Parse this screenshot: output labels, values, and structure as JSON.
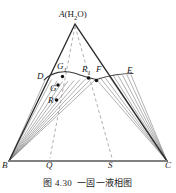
{
  "figure": {
    "caption_number": "图 4.30",
    "caption_text": "一固一液相图",
    "type": "ternary-phase-diagram"
  },
  "labels": {
    "apex": "A",
    "apex_component": "(H",
    "apex_sub": "2",
    "apex_component_end": "O)",
    "apex_full": "A(H2O)",
    "B": "B",
    "C": "C",
    "D": "D",
    "E": "E",
    "F": "F",
    "G": "G",
    "G1_main": "G",
    "G1_sub": "1",
    "R": "R",
    "R1_main": "R",
    "R1_sub": "1",
    "Q": "Q",
    "S": "S"
  },
  "geometry": {
    "triangle": {
      "A": [
        75,
        24
      ],
      "B": [
        9,
        161
      ],
      "C": [
        167,
        161
      ]
    },
    "base_points": {
      "Q": [
        50,
        161
      ],
      "S": [
        112,
        161
      ]
    },
    "curve_points": {
      "D": [
        46,
        78
      ],
      "G1": [
        62,
        74
      ],
      "R1": [
        89,
        76
      ],
      "F": [
        97,
        77
      ],
      "E": [
        131,
        75
      ]
    },
    "marked_dots": [
      [
        62,
        76
      ],
      [
        58,
        85
      ],
      [
        57,
        100
      ],
      [
        89,
        78
      ],
      [
        96,
        80
      ]
    ],
    "dashed_lines": [
      {
        "from": "A",
        "to": "Q"
      },
      {
        "from": "A",
        "to": "S"
      }
    ],
    "fan_left_origin": [
      9,
      161
    ],
    "fan_right_origin": [
      167,
      161
    ]
  },
  "colors": {
    "stroke": "#2a2a2a",
    "light_stroke": "#6e6e6e",
    "base_line": "#8a8a8a",
    "dash": "#8f8f8f",
    "dot": "#111111",
    "background": "#ffffff"
  }
}
